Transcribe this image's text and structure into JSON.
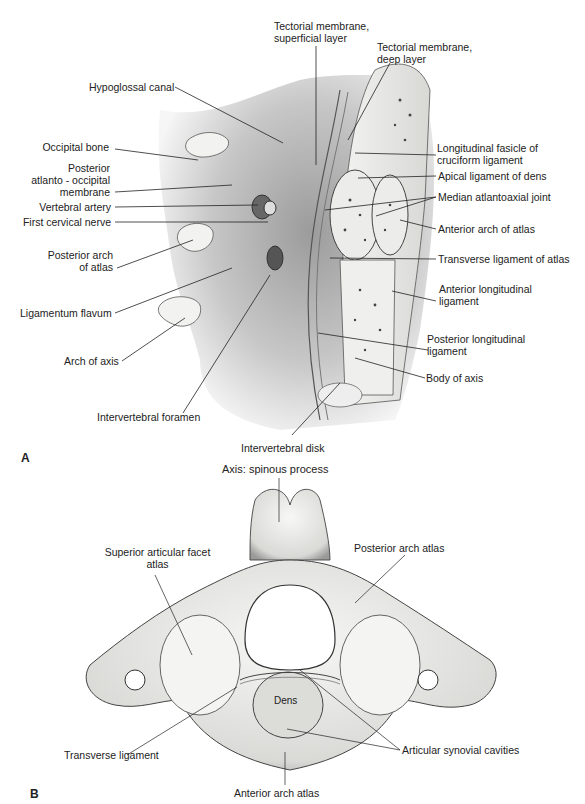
{
  "figure": {
    "panels": [
      {
        "id": "A",
        "label": "A",
        "labels": {
          "tectorial_superficial": "Tectorial membrane,\nsuperficial layer",
          "tectorial_superficial_l1": "Tectorial membrane,",
          "tectorial_superficial_l2": "superficial layer",
          "tectorial_deep_l1": "Tectorial membrane,",
          "tectorial_deep_l2": "deep layer",
          "hypoglossal_canal": "Hypoglossal canal",
          "occipital_bone": "Occipital bone",
          "post_ao_l1": "Posterior",
          "post_ao_l2": "atlanto - occipital",
          "post_ao_l3": "membrane",
          "vertebral_artery": "Vertebral artery",
          "first_cervical_nerve": "First cervical nerve",
          "post_arch_l1": "Posterior arch",
          "post_arch_l2": "of atlas",
          "ligamentum_flavum": "Ligamentum flavum",
          "arch_of_axis": "Arch of axis",
          "intervertebral_foramen": "Intervertebral foramen",
          "intervertebral_disk": "Intervertebral disk",
          "long_fasicle_l1": "Longitudinal fasicle of",
          "long_fasicle_l2": "cruciform ligament",
          "apical_ligament": "Apical ligament of dens",
          "median_atlantoaxial": "Median atlantoaxial joint",
          "anterior_arch_atlas": "Anterior arch of atlas",
          "transverse_ligament_atlas": "Transverse ligament of atlas",
          "ant_long_l1": "Anterior longitudinal",
          "ant_long_l2": "ligament",
          "post_long_l1": "Posterior longitudinal",
          "post_long_l2": "ligament",
          "body_of_axis": "Body of axis"
        }
      },
      {
        "id": "B",
        "label": "B",
        "labels": {
          "axis_spinous": "Axis: spinous process",
          "sup_facet_l1": "Superior articular facet",
          "sup_facet_l2": "atlas",
          "posterior_arch_atlas": "Posterior arch atlas",
          "dens": "Dens",
          "transverse_ligament": "Transverse ligament",
          "articular_synovial": "Articular synovial cavities",
          "anterior_arch_atlas": "Anterior arch atlas"
        }
      }
    ]
  }
}
